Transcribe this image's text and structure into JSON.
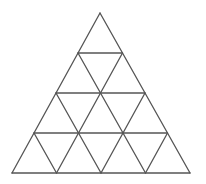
{
  "diagram": {
    "type": "triangular-grid",
    "rows": 4,
    "apex": [
      100,
      13
    ],
    "base_left": [
      12,
      173
    ],
    "base_right": [
      190,
      173
    ],
    "stroke_color": "#555555",
    "stroke_width": 1.3,
    "background": "#ffffff"
  }
}
